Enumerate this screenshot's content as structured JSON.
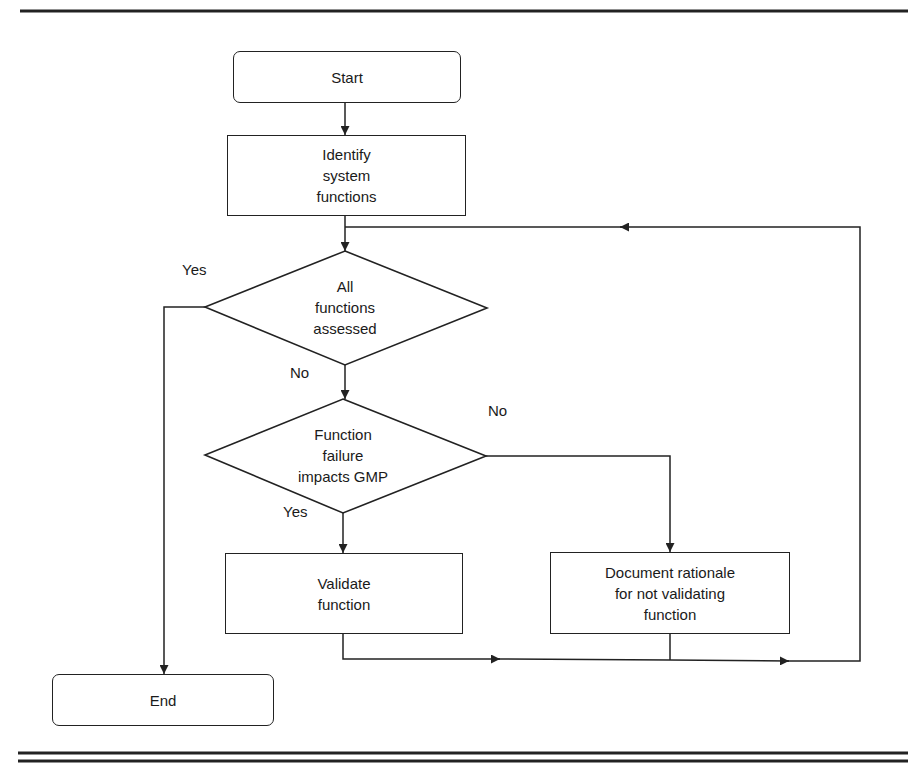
{
  "nodes": {
    "start": {
      "label": "Start"
    },
    "identify": {
      "label": "Identify\nsystem\nfunctions"
    },
    "all_assessed": {
      "label": "All\nfunctions\nassessed"
    },
    "impacts_gmp": {
      "label": "Function\nfailure\nimpacts GMP"
    },
    "validate": {
      "label": "Validate\nfunction"
    },
    "document": {
      "label": "Document rationale\nfor not validating\nfunction"
    },
    "end": {
      "label": "End"
    }
  },
  "edges": {
    "all_assessed_yes": {
      "label": "Yes"
    },
    "all_assessed_no": {
      "label": "No"
    },
    "impacts_gmp_no": {
      "label": "No"
    },
    "impacts_gmp_yes": {
      "label": "Yes"
    }
  },
  "colors": {
    "stroke": "#222222",
    "background": "#ffffff"
  }
}
